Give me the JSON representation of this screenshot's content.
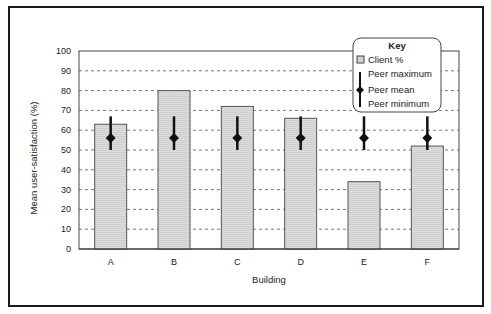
{
  "chart_data": {
    "type": "bar",
    "title": "",
    "xlabel": "Building",
    "ylabel": "Mean user-satisfaction (%)",
    "ylim": [
      0,
      100
    ],
    "yticks": [
      0,
      10,
      20,
      30,
      40,
      50,
      60,
      70,
      80,
      90,
      100
    ],
    "grid": "horizontal dashed",
    "categories": [
      "A",
      "B",
      "C",
      "D",
      "E",
      "F"
    ],
    "series": [
      {
        "name": "Client %",
        "kind": "bar",
        "values": [
          63,
          80,
          72,
          66,
          34,
          52
        ]
      },
      {
        "name": "Peer maximum",
        "kind": "error-top",
        "values": [
          67,
          67,
          67,
          67,
          67,
          67
        ]
      },
      {
        "name": "Peer mean",
        "kind": "marker",
        "values": [
          56,
          56,
          56,
          56,
          56,
          56
        ]
      },
      {
        "name": "Peer minimum",
        "kind": "error-bottom",
        "values": [
          50,
          50,
          50,
          50,
          50,
          50
        ]
      }
    ],
    "legend": {
      "title": "Key",
      "position": "top-right",
      "entries": [
        "Client %",
        "Peer maximum",
        "Peer mean",
        "Peer minimum"
      ]
    },
    "colors": {
      "bar_fill": "#d9d9d9",
      "bar_stroke": "#555555",
      "error": "#111111",
      "grid": "#555555"
    }
  }
}
